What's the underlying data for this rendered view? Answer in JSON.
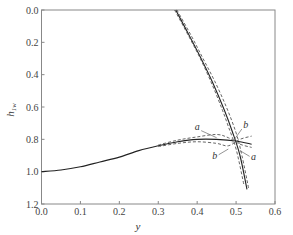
{
  "chart_data": {
    "type": "line",
    "title": "",
    "xlabel": "y",
    "ylabel": "h_1w",
    "ylabel_main": "h",
    "ylabel_sub": "1w",
    "xlim": [
      0.0,
      0.6
    ],
    "ylim": [
      0.0,
      1.2
    ],
    "y_inverted": true,
    "grid": false,
    "legend": null,
    "x_ticks": [
      "0.0",
      "0.1",
      "0.2",
      "0.3",
      "0.4",
      "0.5",
      "0.6"
    ],
    "y_ticks": [
      "0.0",
      "0.2",
      "0.4",
      "0.6",
      "0.8",
      "1.0",
      "1.2"
    ],
    "series": [
      {
        "name": "steep branch (solid)",
        "style": "solid",
        "x": [
          0.345,
          0.38,
          0.41,
          0.44,
          0.47,
          0.49,
          0.51,
          0.528
        ],
        "y": [
          0.0,
          0.16,
          0.3,
          0.45,
          0.62,
          0.75,
          0.9,
          1.11
        ]
      },
      {
        "name": "steep branch a (dashed)",
        "style": "dashed",
        "x": [
          0.342,
          0.38,
          0.41,
          0.44,
          0.465,
          0.48,
          0.5,
          0.52
        ],
        "y": [
          0.0,
          0.17,
          0.31,
          0.47,
          0.62,
          0.72,
          0.86,
          1.08
        ]
      },
      {
        "name": "steep branch b (dashed)",
        "style": "dashed",
        "x": [
          0.348,
          0.385,
          0.415,
          0.445,
          0.475,
          0.5,
          0.515,
          0.532
        ],
        "y": [
          0.0,
          0.16,
          0.3,
          0.44,
          0.6,
          0.76,
          0.9,
          1.1
        ]
      },
      {
        "name": "arch branch (solid)",
        "style": "solid",
        "x": [
          0.0,
          0.05,
          0.1,
          0.15,
          0.2,
          0.25,
          0.3,
          0.35,
          0.4,
          0.45,
          0.5,
          0.54
        ],
        "y": [
          1.0,
          0.99,
          0.97,
          0.94,
          0.91,
          0.87,
          0.84,
          0.815,
          0.8,
          0.8,
          0.81,
          0.83
        ]
      },
      {
        "name": "arch branch a (dashed)",
        "style": "dashed",
        "x": [
          0.3,
          0.35,
          0.4,
          0.45,
          0.48,
          0.51,
          0.54
        ],
        "y": [
          0.835,
          0.805,
          0.785,
          0.77,
          0.79,
          0.83,
          0.85
        ]
      },
      {
        "name": "arch branch b (dashed)",
        "style": "dashed",
        "x": [
          0.3,
          0.35,
          0.4,
          0.45,
          0.48,
          0.51,
          0.54
        ],
        "y": [
          0.845,
          0.825,
          0.815,
          0.825,
          0.84,
          0.8,
          0.78
        ]
      }
    ],
    "annotations": [
      {
        "text": "a",
        "x": 0.4,
        "y": 0.74,
        "points_to": [
          0.45,
          0.79
        ]
      },
      {
        "text": "b",
        "x": 0.525,
        "y": 0.73,
        "points_to": [
          0.49,
          0.82
        ]
      },
      {
        "text": "b",
        "x": 0.445,
        "y": 0.92,
        "points_to": [
          0.48,
          0.86
        ]
      },
      {
        "text": "a",
        "x": 0.545,
        "y": 0.93,
        "points_to": [
          0.51,
          0.87
        ]
      }
    ]
  }
}
